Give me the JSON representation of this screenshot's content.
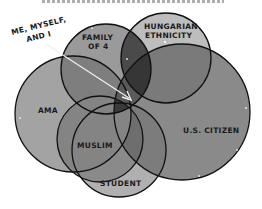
{
  "diagram": {
    "type": "venn",
    "caption_cropped": true,
    "circles": [
      {
        "id": "ama",
        "label": "AMA",
        "cx": 73,
        "cy": 114,
        "r": 58,
        "fill": "#9a9a9a"
      },
      {
        "id": "us-citizen",
        "label": "U.S. CITIZEN",
        "cx": 182,
        "cy": 112,
        "r": 68,
        "fill": "#8a8a8a"
      },
      {
        "id": "hungarian-ethnicity",
        "label_lines": [
          "HUNGARIAN",
          "ETHNICITY"
        ],
        "cx": 166,
        "cy": 58,
        "r": 45,
        "fill": "#b4b4b4"
      },
      {
        "id": "family-of-4",
        "label_lines": [
          "FAMILY",
          "OF 4"
        ],
        "cx": 106,
        "cy": 69,
        "r": 45,
        "fill": "#8c8c8c"
      },
      {
        "id": "student",
        "label": "STUDENT",
        "cx": 119,
        "cy": 150,
        "r": 47,
        "fill": "#a8a8a8"
      },
      {
        "id": "muslim",
        "label": "MUSLIM",
        "cx": 100,
        "cy": 139,
        "r": 43,
        "fill": "#8e8e8e"
      }
    ],
    "annotation": {
      "label_lines": [
        "ME, MYSELF,",
        "AND I"
      ],
      "arrow_from": [
        46,
        44
      ],
      "arrow_to": [
        131,
        100
      ]
    },
    "colors": {
      "outline": "#111111",
      "overlap_dark": "#3a3a3a",
      "arrow": "#f2f2f2"
    }
  },
  "labels": {
    "ama": "AMA",
    "us_citizen": "U.S. CITIZEN",
    "hungarian_1": "HUNGARIAN",
    "hungarian_2": "ETHNICITY",
    "family_1": "FAMILY",
    "family_2": "OF 4",
    "student": "STUDENT",
    "muslim": "MUSLIM",
    "me_1": "ME, MYSELF,",
    "me_2": "AND I"
  }
}
